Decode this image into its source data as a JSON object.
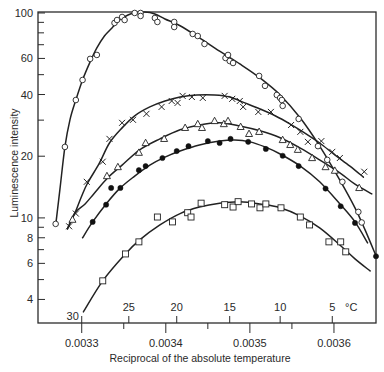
{
  "chart_data": {
    "type": "scatter",
    "title": "",
    "xlabel": "Reciprocal of the absolute temperature",
    "ylabel": "Luminescence intensity",
    "xlim": [
      0.003248,
      0.00365
    ],
    "ylim": [
      3.07,
      101.1
    ],
    "xscale": "linear",
    "yscale": "log",
    "grid": false,
    "legend": null,
    "colors": {
      "ink": "#222222",
      "frame": "#2b2b2b",
      "background": "#ffffff"
    },
    "x_ticks": [
      {
        "value": 0.0033,
        "label": "0.0033"
      },
      {
        "value": 0.0034,
        "label": "0.0034"
      },
      {
        "value": 0.0035,
        "label": "0.0035"
      },
      {
        "value": 0.0036,
        "label": "0.0036"
      }
    ],
    "x_minor_ticks": [
      0.00335,
      0.00345,
      0.00355
    ],
    "y_ticks": [
      {
        "value": 4,
        "label": "4"
      },
      {
        "value": 6,
        "label": "6"
      },
      {
        "value": 8,
        "label": "8"
      },
      {
        "value": 10,
        "label": "10"
      },
      {
        "value": 20,
        "label": "20"
      },
      {
        "value": 40,
        "label": "40"
      },
      {
        "value": 60,
        "label": "60"
      },
      {
        "value": 100,
        "label": "100"
      }
    ],
    "y_minor_ticks": [
      5,
      7,
      9,
      30,
      50,
      70,
      80,
      90
    ],
    "secondary_x_axis": {
      "unit_label": "°C",
      "ticks": [
        {
          "label": "30",
          "value": 0.0033
        },
        {
          "label": "25",
          "value": 0.003356
        },
        {
          "label": "20",
          "value": 0.003413
        },
        {
          "label": "15",
          "value": 0.003476
        },
        {
          "label": "10",
          "value": 0.003536
        },
        {
          "label": "5",
          "value": 0.003598
        }
      ]
    },
    "series": [
      {
        "name": "open circles",
        "marker": "circle-open",
        "points": [
          [
            0.003269,
            9.35
          ],
          [
            0.00328,
            22.2
          ],
          [
            0.003293,
            37.6
          ],
          [
            0.003301,
            47.1
          ],
          [
            0.00331,
            59.7
          ],
          [
            0.003318,
            62.4
          ],
          [
            0.003339,
            89.4
          ],
          [
            0.003342,
            92.4
          ],
          [
            0.003348,
            95.6
          ],
          [
            0.003351,
            92.4
          ],
          [
            0.003363,
            100
          ],
          [
            0.00337,
            100
          ],
          [
            0.00337,
            96.7
          ],
          [
            0.003387,
            94.5
          ],
          [
            0.00339,
            90.4
          ],
          [
            0.00341,
            90.4
          ],
          [
            0.00341,
            85.4
          ],
          [
            0.003432,
            79.0
          ],
          [
            0.003438,
            77.2
          ],
          [
            0.003446,
            70.6
          ],
          [
            0.003471,
            60.3
          ],
          [
            0.003474,
            62.4
          ],
          [
            0.003476,
            58.3
          ],
          [
            0.00348,
            57.0
          ],
          [
            0.003511,
            49.3
          ],
          [
            0.003518,
            44.1
          ],
          [
            0.003532,
            39.8
          ],
          [
            0.003536,
            38.5
          ],
          [
            0.003538,
            37.6
          ],
          [
            0.003539,
            35.2
          ],
          [
            0.003558,
            30.4
          ],
          [
            0.003581,
            22.4
          ],
          [
            0.003592,
            19.2
          ],
          [
            0.00361,
            15.0
          ],
          [
            0.003629,
            10.7
          ],
          [
            0.003633,
            9.5
          ]
        ],
        "curve": [
          [
            0.003269,
            9.2
          ],
          [
            0.003274,
            13.7
          ],
          [
            0.00328,
            22.2
          ],
          [
            0.003286,
            30.1
          ],
          [
            0.003293,
            37.6
          ],
          [
            0.003301,
            47.1
          ],
          [
            0.00331,
            57.7
          ],
          [
            0.003318,
            67.5
          ],
          [
            0.003327,
            77.2
          ],
          [
            0.003336,
            84.5
          ],
          [
            0.003345,
            92.4
          ],
          [
            0.003355,
            97.8
          ],
          [
            0.003363,
            100
          ],
          [
            0.003375,
            101
          ],
          [
            0.003387,
            98.9
          ],
          [
            0.003399,
            93.5
          ],
          [
            0.003417,
            86.6
          ],
          [
            0.00344,
            75.6
          ],
          [
            0.003464,
            65.1
          ],
          [
            0.003488,
            56.4
          ],
          [
            0.003512,
            48.2
          ],
          [
            0.003536,
            39.8
          ],
          [
            0.00356,
            30.7
          ],
          [
            0.003583,
            22.4
          ],
          [
            0.003607,
            15.3
          ],
          [
            0.003625,
            11.2
          ],
          [
            0.003637,
            8.74
          ],
          [
            0.00365,
            6.53
          ]
        ]
      },
      {
        "name": "crosses",
        "marker": "cross",
        "points": [
          [
            0.003285,
            9.1
          ],
          [
            0.003293,
            10.5
          ],
          [
            0.003306,
            15.0
          ],
          [
            0.003325,
            18.8
          ],
          [
            0.003333,
            24.3
          ],
          [
            0.003348,
            29.1
          ],
          [
            0.003361,
            30.1
          ],
          [
            0.003377,
            32.2
          ],
          [
            0.003395,
            34.8
          ],
          [
            0.003407,
            37.2
          ],
          [
            0.003414,
            36.4
          ],
          [
            0.00342,
            39.4
          ],
          [
            0.003431,
            38.9
          ],
          [
            0.003444,
            38.5
          ],
          [
            0.00347,
            39.4
          ],
          [
            0.003479,
            38.1
          ],
          [
            0.003488,
            37.2
          ],
          [
            0.003492,
            34.8
          ],
          [
            0.00351,
            32.9
          ],
          [
            0.003525,
            32.9
          ],
          [
            0.003549,
            28.4
          ],
          [
            0.00356,
            26.3
          ],
          [
            0.003569,
            23.5
          ],
          [
            0.003585,
            23.7
          ],
          [
            0.003598,
            21.0
          ],
          [
            0.003607,
            19.6
          ],
          [
            0.003636,
            16.8
          ]
        ],
        "curve": [
          [
            0.003283,
            8.84
          ],
          [
            0.003292,
            10.6
          ],
          [
            0.0033,
            12.8
          ],
          [
            0.003307,
            14.8
          ],
          [
            0.003321,
            18.5
          ],
          [
            0.003333,
            23.2
          ],
          [
            0.003348,
            27.5
          ],
          [
            0.003363,
            31.5
          ],
          [
            0.003381,
            34.8
          ],
          [
            0.003399,
            37.2
          ],
          [
            0.003417,
            38.9
          ],
          [
            0.003437,
            39.8
          ],
          [
            0.003458,
            39.8
          ],
          [
            0.003476,
            38.9
          ],
          [
            0.003494,
            36.4
          ],
          [
            0.003512,
            34.0
          ],
          [
            0.00353,
            31.5
          ],
          [
            0.003548,
            28.7
          ],
          [
            0.003565,
            26.0
          ],
          [
            0.003583,
            23.2
          ],
          [
            0.003601,
            20.3
          ],
          [
            0.003619,
            17.9
          ],
          [
            0.003635,
            15.8
          ]
        ]
      },
      {
        "name": "open triangles",
        "marker": "triangle-open",
        "points": [
          [
            0.003289,
            9.8
          ],
          [
            0.00333,
            16.0
          ],
          [
            0.003343,
            17.7
          ],
          [
            0.003368,
            20.8
          ],
          [
            0.003376,
            23.2
          ],
          [
            0.003398,
            24.3
          ],
          [
            0.003423,
            27.5
          ],
          [
            0.003438,
            28.7
          ],
          [
            0.003443,
            27.5
          ],
          [
            0.003458,
            29.7
          ],
          [
            0.003469,
            28.7
          ],
          [
            0.003474,
            29.7
          ],
          [
            0.003489,
            27.8
          ],
          [
            0.003499,
            25.7
          ],
          [
            0.003511,
            26.3
          ],
          [
            0.003539,
            24.0
          ],
          [
            0.003548,
            22.7
          ],
          [
            0.003557,
            21.5
          ],
          [
            0.003574,
            19.6
          ],
          [
            0.00359,
            17.7
          ],
          [
            0.003601,
            17.0
          ],
          [
            0.00363,
            14.0
          ]
        ],
        "curve": [
          [
            0.003283,
            8.84
          ],
          [
            0.003292,
            10.6
          ],
          [
            0.003304,
            11.7
          ],
          [
            0.003315,
            13.2
          ],
          [
            0.003331,
            15.7
          ],
          [
            0.003348,
            18.1
          ],
          [
            0.003369,
            21.5
          ],
          [
            0.003393,
            24.3
          ],
          [
            0.003417,
            26.9
          ],
          [
            0.00344,
            28.4
          ],
          [
            0.003464,
            29.1
          ],
          [
            0.003488,
            28.1
          ],
          [
            0.003512,
            26.6
          ],
          [
            0.003536,
            24.6
          ],
          [
            0.00356,
            21.9
          ],
          [
            0.003583,
            19.2
          ],
          [
            0.003607,
            16.6
          ],
          [
            0.003625,
            14.6
          ],
          [
            0.003645,
            13.1
          ]
        ]
      },
      {
        "name": "filled circles",
        "marker": "circle-filled",
        "points": [
          [
            0.003313,
            9.56
          ],
          [
            0.003329,
            11.6
          ],
          [
            0.003335,
            14.0
          ],
          [
            0.003346,
            14.0
          ],
          [
            0.003368,
            17.1
          ],
          [
            0.003376,
            17.9
          ],
          [
            0.003396,
            19.6
          ],
          [
            0.003413,
            21.2
          ],
          [
            0.003427,
            22.4
          ],
          [
            0.00345,
            23.7
          ],
          [
            0.003464,
            23.2
          ],
          [
            0.003477,
            24.3
          ],
          [
            0.003498,
            23.5
          ],
          [
            0.003519,
            21.7
          ],
          [
            0.003539,
            20.1
          ],
          [
            0.003558,
            17.9
          ],
          [
            0.00359,
            13.9
          ],
          [
            0.003608,
            11.4
          ],
          [
            0.003625,
            9.45
          ],
          [
            0.00365,
            6.5
          ]
        ],
        "curve": [
          [
            0.003301,
            8.0
          ],
          [
            0.003313,
            9.56
          ],
          [
            0.003329,
            11.7
          ],
          [
            0.003345,
            13.9
          ],
          [
            0.003363,
            16.0
          ],
          [
            0.003381,
            18.1
          ],
          [
            0.003399,
            19.8
          ],
          [
            0.003417,
            21.2
          ],
          [
            0.00344,
            22.7
          ],
          [
            0.003464,
            23.7
          ],
          [
            0.003482,
            24.0
          ],
          [
            0.0035,
            23.5
          ],
          [
            0.003518,
            22.2
          ],
          [
            0.003536,
            20.5
          ],
          [
            0.00356,
            17.9
          ],
          [
            0.003583,
            15.0
          ],
          [
            0.003607,
            11.7
          ],
          [
            0.003625,
            9.56
          ],
          [
            0.00364,
            7.55
          ]
        ]
      },
      {
        "name": "open squares",
        "marker": "square-open",
        "points": [
          [
            0.003325,
            4.93
          ],
          [
            0.003352,
            6.67
          ],
          [
            0.003368,
            7.64
          ],
          [
            0.00339,
            10.1
          ],
          [
            0.003408,
            9.56
          ],
          [
            0.003426,
            10.6
          ],
          [
            0.00343,
            10.1
          ],
          [
            0.003442,
            11.8
          ],
          [
            0.00347,
            11.6
          ],
          [
            0.00348,
            11.3
          ],
          [
            0.003486,
            12.0
          ],
          [
            0.003502,
            11.7
          ],
          [
            0.003512,
            11.2
          ],
          [
            0.003519,
            11.7
          ],
          [
            0.003537,
            11.2
          ],
          [
            0.00356,
            10.1
          ],
          [
            0.003571,
            9.24
          ],
          [
            0.003594,
            7.64
          ],
          [
            0.003608,
            7.64
          ],
          [
            0.003614,
            6.83
          ]
        ],
        "curve": [
          [
            0.003302,
            3.48
          ],
          [
            0.003325,
            4.93
          ],
          [
            0.003352,
            6.67
          ],
          [
            0.003369,
            7.81
          ],
          [
            0.003393,
            9.24
          ],
          [
            0.003417,
            10.5
          ],
          [
            0.00344,
            11.3
          ],
          [
            0.003464,
            11.8
          ],
          [
            0.003488,
            12.0
          ],
          [
            0.003512,
            11.7
          ],
          [
            0.003536,
            11.2
          ],
          [
            0.00356,
            10.2
          ],
          [
            0.003583,
            8.94
          ],
          [
            0.003607,
            7.38
          ],
          [
            0.003625,
            6.31
          ],
          [
            0.003643,
            5.51
          ]
        ]
      }
    ]
  }
}
